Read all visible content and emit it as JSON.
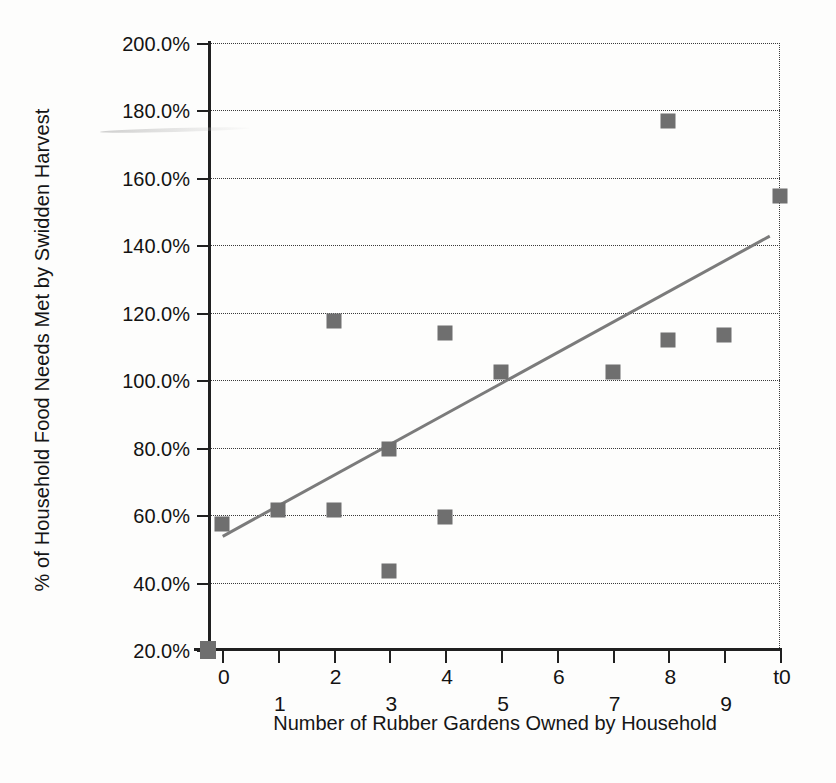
{
  "chart_data": {
    "type": "scatter",
    "title": "",
    "xlabel": "Number of Rubber Gardens Owned by Household",
    "ylabel": "% of Household Food Needs Met by Swidden Harvest",
    "xlim": [
      -0.25,
      10.0
    ],
    "ylim": [
      20.0,
      200.0
    ],
    "grid": true,
    "legend": "none",
    "marker_color": "#6f6f6f",
    "trendline_color": "#7b7b7b",
    "axis_color": "#202020",
    "xticks": [
      {
        "value": 0,
        "label": "0",
        "row": "high"
      },
      {
        "value": 1,
        "label": "1",
        "row": "low"
      },
      {
        "value": 2,
        "label": "2",
        "row": "high"
      },
      {
        "value": 3,
        "label": "3",
        "row": "low"
      },
      {
        "value": 4,
        "label": "4",
        "row": "high"
      },
      {
        "value": 5,
        "label": "5",
        "row": "low"
      },
      {
        "value": 6,
        "label": "6",
        "row": "high"
      },
      {
        "value": 7,
        "label": "7",
        "row": "low"
      },
      {
        "value": 8,
        "label": "8",
        "row": "high"
      },
      {
        "value": 9,
        "label": "9",
        "row": "low"
      },
      {
        "value": 10,
        "label": "t0",
        "row": "high"
      }
    ],
    "yticks": [
      {
        "value": 200.0,
        "label": "200.0%"
      },
      {
        "value": 180.0,
        "label": "180.0%"
      },
      {
        "value": 160.0,
        "label": "160.0%"
      },
      {
        "value": 140.0,
        "label": "140.0%"
      },
      {
        "value": 120.0,
        "label": "120.0%"
      },
      {
        "value": 100.0,
        "label": "100.0%"
      },
      {
        "value": 80.0,
        "label": "80.0%"
      },
      {
        "value": 60.0,
        "label": "60.0%"
      },
      {
        "value": 40.0,
        "label": "40.0%"
      },
      {
        "value": 20.0,
        "label": "20.0%"
      }
    ],
    "points": [
      {
        "x": 0,
        "y": 57.5
      },
      {
        "x": 1,
        "y": 61.5
      },
      {
        "x": 2,
        "y": 117.5
      },
      {
        "x": 2,
        "y": 61.5
      },
      {
        "x": 3,
        "y": 79.5
      },
      {
        "x": 3,
        "y": 43.5
      },
      {
        "x": 4,
        "y": 114.0
      },
      {
        "x": 4,
        "y": 59.5
      },
      {
        "x": 5,
        "y": 102.5
      },
      {
        "x": 7,
        "y": 102.5
      },
      {
        "x": 8,
        "y": 177.0
      },
      {
        "x": 8,
        "y": 112.0
      },
      {
        "x": 9,
        "y": 113.5
      },
      {
        "x": 10,
        "y": 154.7
      }
    ],
    "series_key_marker": {
      "x": -0.25,
      "y": 20.0
    },
    "trendline": {
      "x0": 0.0,
      "y0": 54.0,
      "x1": 9.8,
      "y1": 143.0
    }
  }
}
